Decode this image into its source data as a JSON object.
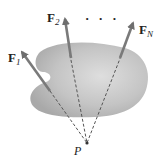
{
  "diagram": {
    "body": {
      "fill": "#b8b8b8",
      "highlight": "#dcdcdc"
    },
    "forces": [
      {
        "label": "F",
        "subscript": "1"
      },
      {
        "label": "F",
        "subscript": "2"
      },
      {
        "label": "F",
        "subscript": "N"
      }
    ],
    "ellipsis": "· · ·",
    "point_label": "P",
    "arrow_color": "#7a7a7a",
    "dash_color": "#555555"
  }
}
